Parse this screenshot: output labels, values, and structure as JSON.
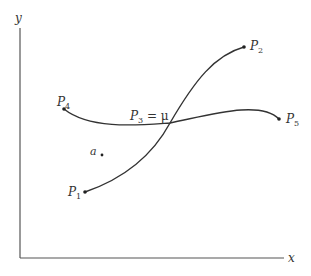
{
  "diagram": {
    "axes": {
      "x_label": "x",
      "y_label": "y"
    },
    "points": {
      "p1": {
        "label": "P",
        "sub": "1"
      },
      "p2": {
        "label": "P",
        "sub": "2"
      },
      "p3": {
        "label": "P",
        "sub": "3",
        "suffix": " = μ"
      },
      "p4": {
        "label": "P",
        "sub": "4"
      },
      "p5": {
        "label": "P",
        "sub": "5"
      },
      "a": {
        "label": "a"
      }
    },
    "curves": [
      {
        "name": "curve-p1-p2",
        "from": "P1",
        "to": "P2",
        "through": "P3"
      },
      {
        "name": "curve-p4-p5",
        "from": "P4",
        "to": "P5",
        "through": "P3"
      }
    ],
    "colors": {
      "ink": "#333333",
      "background": "#ffffff"
    }
  }
}
